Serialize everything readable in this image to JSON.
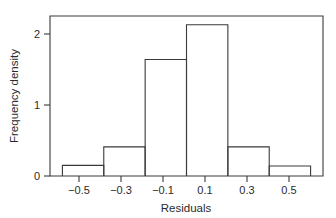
{
  "chart_data": {
    "type": "bar",
    "title": "",
    "subtitle": "",
    "xlabel": "Residuals",
    "ylabel": "Frequency density",
    "categories": [
      "-0.6 to -0.4",
      "-0.4 to -0.2",
      "-0.2 to 0.0",
      "0.0 to 0.2",
      "0.2 to 0.4",
      "0.4 to 0.6"
    ],
    "bin_edges": [
      -0.6,
      -0.4,
      -0.2,
      0.0,
      0.2,
      0.4,
      0.6
    ],
    "values": [
      0.15,
      0.41,
      1.64,
      2.13,
      0.41,
      0.14
    ],
    "xlim": [
      -0.66,
      -0.66
    ],
    "x_axis_range": [
      -0.66,
      0.66
    ],
    "ylim": [
      0,
      2.3
    ],
    "xticks": [
      -0.5,
      -0.3,
      -0.1,
      0.1,
      0.3,
      0.5
    ],
    "xticklabels": [
      "−0.5",
      "−0.3",
      "−0.1",
      "0.1",
      "0.3",
      "0.5"
    ],
    "yticks": [
      0,
      1,
      2
    ],
    "yticklabels": [
      "0",
      "1",
      "2"
    ],
    "grid": false,
    "legend": false,
    "legend_position": "none",
    "colors": {
      "line": "#3a3a3a",
      "fill": "#ffffff",
      "background": "#ffffff",
      "text": "#2b2b2b"
    }
  },
  "axes": {
    "x_title": "Residuals",
    "y_title": "Frequency density"
  },
  "ticks": {
    "x": [
      {
        "label": "−0.5",
        "value": -0.5
      },
      {
        "label": "−0.3",
        "value": -0.3
      },
      {
        "label": "−0.1",
        "value": -0.1
      },
      {
        "label": "0.1",
        "value": 0.1
      },
      {
        "label": "0.3",
        "value": 0.3
      },
      {
        "label": "0.5",
        "value": 0.5
      }
    ],
    "y": [
      {
        "label": "0",
        "value": 0
      },
      {
        "label": "1",
        "value": 1
      },
      {
        "label": "2",
        "value": 2
      }
    ]
  }
}
